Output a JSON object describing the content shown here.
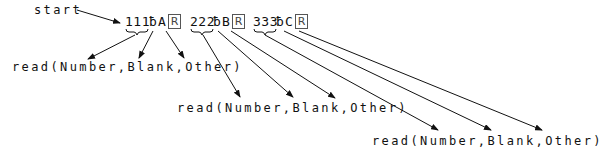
{
  "diagram": {
    "start_label": "start",
    "tokens": [
      {
        "digits": "111",
        "blank": "̸b",
        "letter": "A",
        "return": "R"
      },
      {
        "digits": "222",
        "blank": "̸b",
        "letter": "B",
        "return": "R"
      },
      {
        "digits": "333",
        "blank": "̸b",
        "letter": "C",
        "return": "R"
      }
    ],
    "blank_glyph": "ƀ",
    "reads": [
      {
        "text": "read(Number,Blank,Other)"
      },
      {
        "text": "read(Number,Blank,Other)"
      },
      {
        "text": "read(Number,Blank,Other)"
      }
    ],
    "line_color": "#111111"
  }
}
